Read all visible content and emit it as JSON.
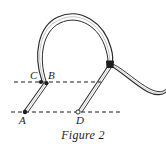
{
  "figure": {
    "caption": "Figure 2",
    "background_color": "#ffffff",
    "ink_color": "#1d1d1d",
    "labels": [
      {
        "id": "C",
        "text": "C",
        "x": 30,
        "y": 70
      },
      {
        "id": "B",
        "text": "B",
        "x": 48,
        "y": 70
      },
      {
        "id": "A",
        "text": "A",
        "x": 19,
        "y": 115
      },
      {
        "id": "D",
        "text": "D",
        "x": 76,
        "y": 115
      }
    ],
    "points": [
      {
        "id": "C",
        "marker": "filled-dot",
        "x": 41,
        "y": 82
      },
      {
        "id": "B",
        "marker": "filled-dot",
        "x": 46,
        "y": 83
      },
      {
        "id": "A",
        "marker": "filled-dot",
        "x": 25,
        "y": 112
      },
      {
        "id": "D",
        "marker": "open-dot",
        "x": 78,
        "y": 112
      },
      {
        "id": "junction",
        "marker": "filled-block",
        "x": 110,
        "y": 65
      }
    ],
    "dashed_lines": [
      {
        "id": "upper-dashed-line",
        "x1": 14,
        "y1": 82,
        "x2": 101,
        "y2": 82
      },
      {
        "id": "lower-dashed-line",
        "x1": 11,
        "y1": 112,
        "x2": 121,
        "y2": 112
      }
    ],
    "straps": [
      {
        "id": "loop-arc",
        "description": "large strap loop arcing from B up over the top and down to the junction"
      },
      {
        "id": "strap-a-to-b",
        "description": "straight strap segment from A up to B"
      },
      {
        "id": "strap-d-to-junction",
        "description": "straight strap segment from D up to the junction"
      },
      {
        "id": "tail",
        "description": "free strap tail curving down and right from the junction"
      }
    ]
  }
}
